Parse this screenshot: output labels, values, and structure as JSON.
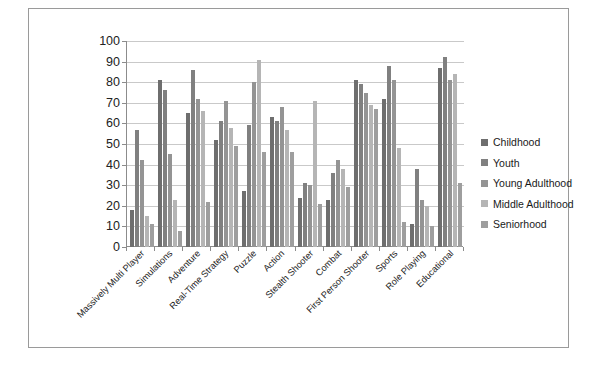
{
  "chart_data": {
    "type": "bar",
    "title": "",
    "xlabel": "",
    "ylabel": "",
    "ylim": [
      0,
      100
    ],
    "ytick_step": 10,
    "yticks": [
      100,
      90,
      80,
      70,
      60,
      50,
      40,
      30,
      20,
      10,
      0
    ],
    "grid": true,
    "legend_position": "right",
    "orientation": "vertical",
    "grouping": "clustered",
    "categories": [
      "Massively Multi Player",
      "Simulations",
      "Adventure",
      "Real-Time Strategy",
      "Puzzle",
      "Action",
      "Stealth Shooter",
      "Combat",
      "First Person Shooter",
      "Sports",
      "Role Playing",
      "Educational"
    ],
    "series": [
      {
        "name": "Childhood",
        "color": "#6e6e6e",
        "values": [
          18,
          81,
          65,
          52,
          27,
          63,
          24,
          23,
          81,
          72,
          11,
          87
        ]
      },
      {
        "name": "Youth",
        "color": "#808080",
        "values": [
          57,
          76,
          86,
          61,
          59,
          61,
          31,
          36,
          79,
          88,
          38,
          92
        ]
      },
      {
        "name": "Young Adulthood",
        "color": "#949494",
        "values": [
          42,
          45,
          72,
          71,
          80,
          68,
          30,
          42,
          75,
          81,
          23,
          81
        ]
      },
      {
        "name": "Middle Adulthood",
        "color": "#b5b5b5",
        "values": [
          15,
          23,
          66,
          58,
          91,
          57,
          71,
          38,
          69,
          48,
          20,
          84
        ]
      },
      {
        "name": "Seniorhood",
        "color": "#9e9e9e",
        "values": [
          11,
          8,
          22,
          49,
          46,
          46,
          21,
          29,
          67,
          12,
          10,
          31
        ]
      }
    ]
  },
  "legend": {
    "items": [
      {
        "label": "Childhood"
      },
      {
        "label": "Youth"
      },
      {
        "label": "Young Adulthood"
      },
      {
        "label": "Middle Adulthood"
      },
      {
        "label": "Seniorhood"
      }
    ]
  }
}
